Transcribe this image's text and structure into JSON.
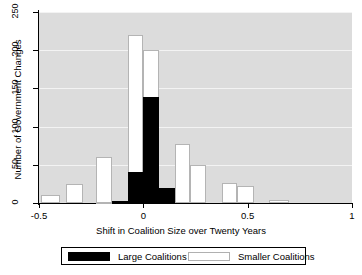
{
  "chart_data": {
    "type": "bar",
    "title": "",
    "subtitle": "",
    "xlabel": "Shift in Coalition Size over Twenty Years",
    "ylabel": "Number of Government Changes",
    "xlim": [
      -0.5,
      1.0
    ],
    "ylim": [
      0,
      250
    ],
    "xticks": [
      -0.5,
      0,
      0.5,
      1
    ],
    "xtick_labels": [
      "-0.5",
      "0",
      "0.5",
      "1"
    ],
    "yticks": [
      0,
      50,
      100,
      150,
      200,
      250
    ],
    "ytick_labels": [
      "0",
      "50",
      "100",
      "150",
      "200",
      "250"
    ],
    "grid": true,
    "grid_axis": "y",
    "grid_color": "#f3f3f3",
    "panel_background": "#dcdcdc",
    "legend_position": "below-plot",
    "bin_width": 0.075,
    "series": [
      {
        "name": "Large Coalitions",
        "color": "#000000",
        "bins": [
          {
            "x_left": -0.15,
            "x_right": -0.075,
            "value": 3
          },
          {
            "x_left": -0.075,
            "x_right": 0.0,
            "value": 10
          },
          {
            "x_left": -0.075,
            "x_right": 0.0,
            "value": 40
          },
          {
            "x_left": 0.0,
            "x_right": 0.075,
            "value": 139
          },
          {
            "x_left": 0.075,
            "x_right": 0.15,
            "value": 19
          }
        ],
        "values": [
          3,
          10,
          40,
          139,
          19
        ]
      },
      {
        "name": "Smaller Coalitions",
        "color": "#ffffff",
        "bins": [
          {
            "x_left": -0.49,
            "x_right": -0.4,
            "value": 10
          },
          {
            "x_left": -0.37,
            "x_right": -0.29,
            "value": 25
          },
          {
            "x_left": -0.225,
            "x_right": -0.15,
            "value": 1
          },
          {
            "x_left": -0.225,
            "x_right": -0.15,
            "value": 60
          },
          {
            "x_left": -0.15,
            "x_right": -0.075,
            "value": 2
          },
          {
            "x_left": -0.075,
            "x_right": 0.0,
            "value": 220
          },
          {
            "x_left": 0.0,
            "x_right": 0.075,
            "value": 200
          },
          {
            "x_left": 0.15,
            "x_right": 0.225,
            "value": 77
          },
          {
            "x_left": 0.225,
            "x_right": 0.3,
            "value": 50
          },
          {
            "x_left": 0.375,
            "x_right": 0.45,
            "value": 26
          },
          {
            "x_left": 0.45,
            "x_right": 0.53,
            "value": 22
          },
          {
            "x_left": 0.6,
            "x_right": 0.7,
            "value": 4
          }
        ],
        "values": [
          10,
          25,
          60,
          1,
          2,
          220,
          200,
          77,
          50,
          26,
          22,
          4
        ]
      }
    ]
  },
  "legend": {
    "entries": [
      {
        "label": "Large Coalitions",
        "swatch": "black"
      },
      {
        "label": "Smaller Coalitions",
        "swatch": "white"
      }
    ]
  }
}
